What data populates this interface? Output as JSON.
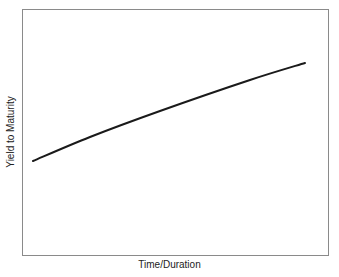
{
  "chart_data": {
    "type": "line",
    "title": "",
    "xlabel": "Time/Duration",
    "ylabel": "Yield to Maturity",
    "grid": false,
    "legend": null,
    "x_ticks": [],
    "y_ticks": [],
    "series": [
      {
        "name": "yield curve",
        "color": "#1a1a1a",
        "points_px": [
          [
            33,
            161
          ],
          [
            90,
            137
          ],
          [
            160,
            111
          ],
          [
            250,
            80
          ],
          [
            305,
            63
          ]
        ],
        "x": [
          0.04,
          0.22,
          0.45,
          0.74,
          0.92
        ],
        "y": [
          0.38,
          0.48,
          0.59,
          0.71,
          0.78
        ]
      }
    ],
    "xlim": [
      0,
      1
    ],
    "ylim": [
      0,
      1
    ],
    "frame_color": "#8a8a8a"
  }
}
